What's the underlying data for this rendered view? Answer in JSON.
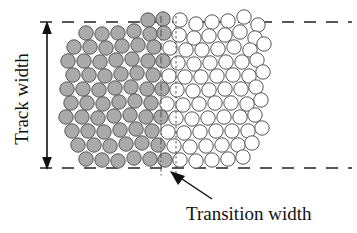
{
  "figure": {
    "type": "diagram",
    "background_color": "#ffffff"
  },
  "labels": {
    "track_width": "Track width",
    "transition_width": "Transition width"
  },
  "colors": {
    "grain_fill_magnetized": "#aaaaaa",
    "grain_fill_unmagnetized": "#ffffff",
    "grain_stroke": "#555555",
    "line_color": "#222222",
    "text_color": "#111111"
  },
  "annotations": {
    "track_width_arrow": {
      "name": "double-headed-vertical-arrow",
      "x": 47,
      "y_top": 24,
      "y_bottom": 167
    },
    "transition_pointer_arrow": {
      "name": "leader-arrow",
      "from_x": 213,
      "from_y": 200,
      "to_x": 172,
      "to_y": 172
    },
    "boundary_lines": [
      {
        "name": "top-dashed-boundary",
        "y": 22,
        "x1": 40,
        "x2": 352
      },
      {
        "name": "bottom-dashed-boundary",
        "y": 168,
        "x1": 40,
        "x2": 352
      }
    ],
    "transition_markers": [
      {
        "name": "transition-left-dashdot-line",
        "x": 161,
        "y1": 16,
        "y2": 178
      },
      {
        "name": "transition-right-dotted-line",
        "x": 176,
        "y1": 16,
        "y2": 178
      }
    ]
  },
  "chart_data": {
    "type": "scatter",
    "title": "",
    "xlabel": "",
    "ylabel": "",
    "grain_radius": 7.2,
    "transition_left_x": 161,
    "transition_right_x": 176,
    "grains": [
      {
        "x": 148,
        "y": 20,
        "state": "magnetized"
      },
      {
        "x": 163,
        "y": 19,
        "state": "magnetized"
      },
      {
        "x": 180,
        "y": 20,
        "state": "unmagnetized"
      },
      {
        "x": 196,
        "y": 24,
        "state": "unmagnetized"
      },
      {
        "x": 212,
        "y": 22,
        "state": "unmagnetized"
      },
      {
        "x": 228,
        "y": 21,
        "state": "unmagnetized"
      },
      {
        "x": 244,
        "y": 17,
        "state": "unmagnetized"
      },
      {
        "x": 258,
        "y": 25,
        "state": "unmagnetized"
      },
      {
        "x": 86,
        "y": 33,
        "state": "magnetized"
      },
      {
        "x": 102,
        "y": 34,
        "state": "magnetized"
      },
      {
        "x": 118,
        "y": 33,
        "state": "magnetized"
      },
      {
        "x": 134,
        "y": 31,
        "state": "magnetized"
      },
      {
        "x": 150,
        "y": 34,
        "state": "magnetized"
      },
      {
        "x": 164,
        "y": 33,
        "state": "magnetized"
      },
      {
        "x": 179,
        "y": 35,
        "state": "unmagnetized"
      },
      {
        "x": 194,
        "y": 38,
        "state": "unmagnetized"
      },
      {
        "x": 209,
        "y": 36,
        "state": "unmagnetized"
      },
      {
        "x": 225,
        "y": 35,
        "state": "unmagnetized"
      },
      {
        "x": 240,
        "y": 32,
        "state": "unmagnetized"
      },
      {
        "x": 255,
        "y": 38,
        "state": "unmagnetized"
      },
      {
        "x": 74,
        "y": 47,
        "state": "magnetized"
      },
      {
        "x": 90,
        "y": 47,
        "state": "magnetized"
      },
      {
        "x": 106,
        "y": 48,
        "state": "magnetized"
      },
      {
        "x": 122,
        "y": 46,
        "state": "magnetized"
      },
      {
        "x": 138,
        "y": 45,
        "state": "magnetized"
      },
      {
        "x": 154,
        "y": 47,
        "state": "magnetized"
      },
      {
        "x": 170,
        "y": 48,
        "state": "unmagnetized"
      },
      {
        "x": 186,
        "y": 50,
        "state": "unmagnetized"
      },
      {
        "x": 202,
        "y": 50,
        "state": "unmagnetized"
      },
      {
        "x": 218,
        "y": 49,
        "state": "unmagnetized"
      },
      {
        "x": 234,
        "y": 47,
        "state": "unmagnetized"
      },
      {
        "x": 250,
        "y": 50,
        "state": "unmagnetized"
      },
      {
        "x": 264,
        "y": 44,
        "state": "unmagnetized"
      },
      {
        "x": 68,
        "y": 61,
        "state": "magnetized"
      },
      {
        "x": 84,
        "y": 61,
        "state": "magnetized"
      },
      {
        "x": 100,
        "y": 62,
        "state": "magnetized"
      },
      {
        "x": 116,
        "y": 60,
        "state": "magnetized"
      },
      {
        "x": 132,
        "y": 59,
        "state": "magnetized"
      },
      {
        "x": 148,
        "y": 61,
        "state": "magnetized"
      },
      {
        "x": 163,
        "y": 61,
        "state": "magnetized"
      },
      {
        "x": 178,
        "y": 63,
        "state": "unmagnetized"
      },
      {
        "x": 194,
        "y": 64,
        "state": "unmagnetized"
      },
      {
        "x": 210,
        "y": 63,
        "state": "unmagnetized"
      },
      {
        "x": 226,
        "y": 62,
        "state": "unmagnetized"
      },
      {
        "x": 242,
        "y": 62,
        "state": "unmagnetized"
      },
      {
        "x": 257,
        "y": 60,
        "state": "unmagnetized"
      },
      {
        "x": 73,
        "y": 75,
        "state": "magnetized"
      },
      {
        "x": 89,
        "y": 75,
        "state": "magnetized"
      },
      {
        "x": 105,
        "y": 76,
        "state": "magnetized"
      },
      {
        "x": 121,
        "y": 74,
        "state": "magnetized"
      },
      {
        "x": 137,
        "y": 73,
        "state": "magnetized"
      },
      {
        "x": 153,
        "y": 75,
        "state": "magnetized"
      },
      {
        "x": 169,
        "y": 76,
        "state": "unmagnetized"
      },
      {
        "x": 185,
        "y": 77,
        "state": "unmagnetized"
      },
      {
        "x": 201,
        "y": 77,
        "state": "unmagnetized"
      },
      {
        "x": 217,
        "y": 76,
        "state": "unmagnetized"
      },
      {
        "x": 233,
        "y": 75,
        "state": "unmagnetized"
      },
      {
        "x": 249,
        "y": 76,
        "state": "unmagnetized"
      },
      {
        "x": 263,
        "y": 72,
        "state": "unmagnetized"
      },
      {
        "x": 67,
        "y": 89,
        "state": "magnetized"
      },
      {
        "x": 83,
        "y": 89,
        "state": "magnetized"
      },
      {
        "x": 99,
        "y": 90,
        "state": "magnetized"
      },
      {
        "x": 115,
        "y": 88,
        "state": "magnetized"
      },
      {
        "x": 131,
        "y": 87,
        "state": "magnetized"
      },
      {
        "x": 147,
        "y": 89,
        "state": "magnetized"
      },
      {
        "x": 162,
        "y": 89,
        "state": "magnetized"
      },
      {
        "x": 177,
        "y": 90,
        "state": "unmagnetized"
      },
      {
        "x": 193,
        "y": 91,
        "state": "unmagnetized"
      },
      {
        "x": 209,
        "y": 90,
        "state": "unmagnetized"
      },
      {
        "x": 225,
        "y": 89,
        "state": "unmagnetized"
      },
      {
        "x": 241,
        "y": 89,
        "state": "unmagnetized"
      },
      {
        "x": 256,
        "y": 87,
        "state": "unmagnetized"
      },
      {
        "x": 71,
        "y": 103,
        "state": "magnetized"
      },
      {
        "x": 87,
        "y": 103,
        "state": "magnetized"
      },
      {
        "x": 103,
        "y": 104,
        "state": "magnetized"
      },
      {
        "x": 119,
        "y": 102,
        "state": "magnetized"
      },
      {
        "x": 135,
        "y": 101,
        "state": "magnetized"
      },
      {
        "x": 151,
        "y": 103,
        "state": "magnetized"
      },
      {
        "x": 167,
        "y": 104,
        "state": "unmagnetized"
      },
      {
        "x": 183,
        "y": 105,
        "state": "unmagnetized"
      },
      {
        "x": 199,
        "y": 104,
        "state": "unmagnetized"
      },
      {
        "x": 215,
        "y": 103,
        "state": "unmagnetized"
      },
      {
        "x": 231,
        "y": 103,
        "state": "unmagnetized"
      },
      {
        "x": 247,
        "y": 104,
        "state": "unmagnetized"
      },
      {
        "x": 261,
        "y": 100,
        "state": "unmagnetized"
      },
      {
        "x": 66,
        "y": 117,
        "state": "magnetized"
      },
      {
        "x": 82,
        "y": 117,
        "state": "magnetized"
      },
      {
        "x": 98,
        "y": 118,
        "state": "magnetized"
      },
      {
        "x": 114,
        "y": 116,
        "state": "magnetized"
      },
      {
        "x": 130,
        "y": 115,
        "state": "magnetized"
      },
      {
        "x": 146,
        "y": 117,
        "state": "magnetized"
      },
      {
        "x": 161,
        "y": 117,
        "state": "magnetized"
      },
      {
        "x": 176,
        "y": 118,
        "state": "unmagnetized"
      },
      {
        "x": 192,
        "y": 119,
        "state": "unmagnetized"
      },
      {
        "x": 208,
        "y": 118,
        "state": "unmagnetized"
      },
      {
        "x": 224,
        "y": 117,
        "state": "unmagnetized"
      },
      {
        "x": 240,
        "y": 117,
        "state": "unmagnetized"
      },
      {
        "x": 255,
        "y": 115,
        "state": "unmagnetized"
      },
      {
        "x": 72,
        "y": 131,
        "state": "magnetized"
      },
      {
        "x": 88,
        "y": 131,
        "state": "magnetized"
      },
      {
        "x": 104,
        "y": 132,
        "state": "magnetized"
      },
      {
        "x": 120,
        "y": 130,
        "state": "magnetized"
      },
      {
        "x": 136,
        "y": 129,
        "state": "magnetized"
      },
      {
        "x": 152,
        "y": 131,
        "state": "magnetized"
      },
      {
        "x": 168,
        "y": 132,
        "state": "unmagnetized"
      },
      {
        "x": 184,
        "y": 133,
        "state": "unmagnetized"
      },
      {
        "x": 200,
        "y": 132,
        "state": "unmagnetized"
      },
      {
        "x": 216,
        "y": 131,
        "state": "unmagnetized"
      },
      {
        "x": 232,
        "y": 131,
        "state": "unmagnetized"
      },
      {
        "x": 248,
        "y": 131,
        "state": "unmagnetized"
      },
      {
        "x": 262,
        "y": 128,
        "state": "unmagnetized"
      },
      {
        "x": 78,
        "y": 145,
        "state": "magnetized"
      },
      {
        "x": 94,
        "y": 145,
        "state": "magnetized"
      },
      {
        "x": 110,
        "y": 146,
        "state": "magnetized"
      },
      {
        "x": 126,
        "y": 144,
        "state": "magnetized"
      },
      {
        "x": 142,
        "y": 143,
        "state": "magnetized"
      },
      {
        "x": 158,
        "y": 145,
        "state": "magnetized"
      },
      {
        "x": 174,
        "y": 146,
        "state": "unmagnetized"
      },
      {
        "x": 190,
        "y": 147,
        "state": "unmagnetized"
      },
      {
        "x": 206,
        "y": 146,
        "state": "unmagnetized"
      },
      {
        "x": 222,
        "y": 145,
        "state": "unmagnetized"
      },
      {
        "x": 238,
        "y": 145,
        "state": "unmagnetized"
      },
      {
        "x": 252,
        "y": 143,
        "state": "unmagnetized"
      },
      {
        "x": 86,
        "y": 159,
        "state": "magnetized"
      },
      {
        "x": 102,
        "y": 160,
        "state": "magnetized"
      },
      {
        "x": 118,
        "y": 161,
        "state": "magnetized"
      },
      {
        "x": 134,
        "y": 158,
        "state": "magnetized"
      },
      {
        "x": 150,
        "y": 159,
        "state": "magnetized"
      },
      {
        "x": 165,
        "y": 160,
        "state": "magnetized"
      },
      {
        "x": 180,
        "y": 160,
        "state": "unmagnetized"
      },
      {
        "x": 196,
        "y": 161,
        "state": "unmagnetized"
      },
      {
        "x": 212,
        "y": 160,
        "state": "unmagnetized"
      },
      {
        "x": 228,
        "y": 159,
        "state": "unmagnetized"
      },
      {
        "x": 243,
        "y": 157,
        "state": "unmagnetized"
      }
    ]
  }
}
